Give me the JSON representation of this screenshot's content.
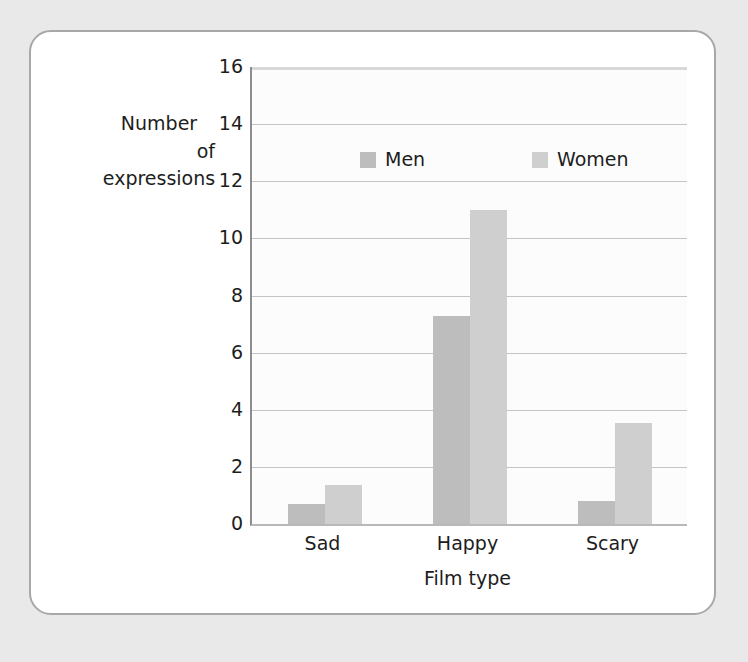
{
  "chart_data": {
    "type": "bar",
    "title": "",
    "xlabel": "Film type",
    "ylabel": "Number of expressions",
    "ylabel_lines": [
      "Number",
      "of",
      "expressions"
    ],
    "categories": [
      "Sad",
      "Happy",
      "Scary"
    ],
    "series": [
      {
        "name": "Men",
        "values": [
          0.7,
          7.3,
          0.8
        ],
        "color": "#bdbdbd"
      },
      {
        "name": "Women",
        "values": [
          1.35,
          11.0,
          3.55
        ],
        "color": "#cfcfcf"
      }
    ],
    "ylim": [
      0,
      16
    ],
    "ytick_labels": [
      "16",
      "14",
      "12",
      "10",
      "8",
      "6",
      "4",
      "2",
      "0"
    ],
    "ytick_values": [
      16,
      14,
      12,
      10,
      8,
      6,
      4,
      2,
      0
    ],
    "grid": true,
    "legend_position": "inside-top-center",
    "legend_entries": [
      "Men",
      "Women"
    ]
  },
  "figure": {
    "card_border_color": "#a8a8a8",
    "background_color": "#e9e9e9",
    "plot_background_color": "#fcfcfc",
    "gridline_color": "#c4c4c4",
    "axis_color": "#8d8d8d",
    "text_color": "#1d1d1d"
  }
}
